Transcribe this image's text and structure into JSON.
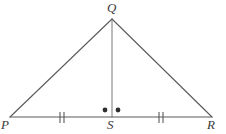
{
  "figure": {
    "kind": "geometry-diagram",
    "shape_name": "triangle",
    "background_color": "#ffffff",
    "stroke_color": "#5a5a5a",
    "label_color": "#3a3a3a",
    "width": 226,
    "height": 134
  },
  "labels": {
    "apex": "Q",
    "left_base": "P",
    "foot": "S",
    "right_base": "R"
  },
  "points": {
    "Q": {
      "x": 112,
      "y": 19
    },
    "P": {
      "x": 10,
      "y": 117
    },
    "S": {
      "x": 112,
      "y": 117
    },
    "R": {
      "x": 212,
      "y": 117
    }
  },
  "segments": [
    {
      "name": "PQ",
      "from": "P",
      "to": "Q",
      "stroke_width": 1.1
    },
    {
      "name": "QR",
      "from": "Q",
      "to": "R",
      "stroke_width": 1.1
    },
    {
      "name": "PR",
      "from": "P",
      "to": "R",
      "stroke_width": 1.1
    },
    {
      "name": "QS",
      "from": "Q",
      "to": "S",
      "stroke_width": 0.9
    }
  ],
  "tick_marks": [
    {
      "name": "tick-PS",
      "segment": "PS",
      "count": 2,
      "x_positions": [
        60,
        64
      ],
      "y_top": 112,
      "y_bottom": 123
    },
    {
      "name": "tick-SR",
      "segment": "SR",
      "count": 2,
      "x_positions": [
        159,
        163
      ],
      "y_top": 112,
      "y_bottom": 123
    }
  ],
  "angle_dots": [
    {
      "name": "angle-dot-left",
      "angle": "QSP",
      "x": 105,
      "y": 110,
      "r": 2.4
    },
    {
      "name": "angle-dot-right",
      "angle": "QSR",
      "x": 118,
      "y": 110,
      "r": 2.4
    }
  ]
}
